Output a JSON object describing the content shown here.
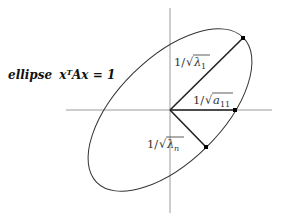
{
  "diagram": {
    "title_label": {
      "word": "ellipse",
      "equation": "xᵀAx = 1"
    },
    "labels": {
      "lambda1": {
        "prefix": "1/",
        "radicand": "λ",
        "sub": "1"
      },
      "a11": {
        "prefix": "1/",
        "radicand": "a",
        "sub": "11"
      },
      "lambdan": {
        "prefix": "1/",
        "radicand": "λ",
        "sub": "n"
      }
    },
    "colors": {
      "axis": "#9a9a9a",
      "ellipse": "#333333",
      "segment": "#222222",
      "point": "#000000"
    }
  }
}
